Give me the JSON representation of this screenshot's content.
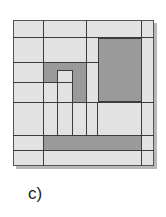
{
  "figure": {
    "caption": "c)",
    "colors": {
      "light": "#e2e2e2",
      "dark": "#9a9a9a",
      "line": "#3c3c3c",
      "shadow": "#b8b8b8"
    },
    "board": {
      "x": 13,
      "y": 20,
      "w": 141,
      "h": 146
    },
    "dark_regions": [
      {
        "name": "large-right-block",
        "x": 98,
        "y": 37,
        "w": 43,
        "h": 65
      },
      {
        "name": "l-shape-top",
        "x": 43,
        "y": 62,
        "w": 43,
        "h": 8
      },
      {
        "name": "l-shape-left",
        "x": 43,
        "y": 62,
        "w": 14,
        "h": 20
      },
      {
        "name": "l-shape-right",
        "x": 73,
        "y": 62,
        "w": 13,
        "h": 40
      },
      {
        "name": "bottom-bar",
        "x": 43,
        "y": 135,
        "w": 98,
        "h": 15
      }
    ],
    "lines": [
      {
        "x": 13,
        "y": 37,
        "w": 141,
        "h": 1
      },
      {
        "x": 13,
        "y": 62,
        "w": 85,
        "h": 1
      },
      {
        "x": 13,
        "y": 82,
        "w": 44,
        "h": 1
      },
      {
        "x": 13,
        "y": 102,
        "w": 141,
        "h": 1
      },
      {
        "x": 13,
        "y": 135,
        "w": 141,
        "h": 1
      },
      {
        "x": 13,
        "y": 150,
        "w": 141,
        "h": 1
      },
      {
        "x": 57,
        "y": 70,
        "w": 16,
        "h": 1
      },
      {
        "x": 57,
        "y": 82,
        "w": 16,
        "h": 1
      },
      {
        "x": 43,
        "y": 20,
        "w": 1,
        "h": 146
      },
      {
        "x": 86,
        "y": 20,
        "w": 1,
        "h": 115
      },
      {
        "x": 98,
        "y": 37,
        "w": 1,
        "h": 65
      },
      {
        "x": 141,
        "y": 20,
        "w": 1,
        "h": 146
      },
      {
        "x": 57,
        "y": 70,
        "w": 1,
        "h": 65
      },
      {
        "x": 72,
        "y": 70,
        "w": 1,
        "h": 65
      },
      {
        "x": 97,
        "y": 102,
        "w": 1,
        "h": 33
      },
      {
        "x": 98,
        "y": 101,
        "w": 43,
        "h": 2
      },
      {
        "x": 98,
        "y": 37,
        "w": 43,
        "h": 2
      }
    ]
  }
}
